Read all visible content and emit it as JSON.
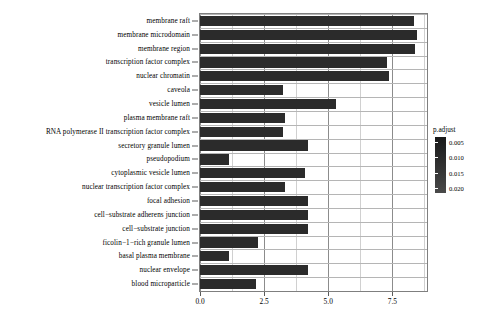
{
  "chart_data": {
    "type": "bar",
    "orientation": "horizontal",
    "title": "",
    "xlabel": "",
    "ylabel": "",
    "xlim": [
      0,
      8.85
    ],
    "xticks": [
      "0.0",
      "2.5",
      "5.0",
      "7.5"
    ],
    "xtick_values": [
      0,
      2.5,
      5.0,
      7.5
    ],
    "grid": true,
    "legend_position": "right",
    "bar_color": "#2b2b2b",
    "categories": [
      "membrane raft",
      "membrane microdomain",
      "membrane region",
      "transcription factor complex",
      "nuclear chromatin",
      "caveola",
      "vesicle lumen",
      "plasma membrane raft",
      "RNA polymerase II transcription factor complex",
      "secretory granule lumen",
      "pseudopodium",
      "cytoplasmic vesicle lumen",
      "nuclear transcription factor complex",
      "focal adhesion",
      "cell−substrate adherens junction",
      "cell−substrate junction",
      "ficolin−1−rich granule lumen",
      "basal plasma membrane",
      "nuclear envelope",
      "blood microparticle"
    ],
    "values": [
      8.35,
      8.45,
      8.4,
      7.3,
      7.35,
      3.25,
      5.3,
      3.3,
      3.25,
      4.2,
      1.15,
      4.1,
      3.3,
      4.2,
      4.2,
      4.2,
      2.25,
      1.15,
      4.2,
      2.2
    ]
  },
  "legend": {
    "title": "p.adjust",
    "ticks": [
      "0.005",
      "0.010",
      "0.015",
      "0.020"
    ],
    "tick_values": [
      0.005,
      0.01,
      0.015,
      0.02
    ],
    "scale_min": 0.0035,
    "scale_max": 0.0215,
    "color_high": "#4a4a4a",
    "color_low": "#191919"
  }
}
